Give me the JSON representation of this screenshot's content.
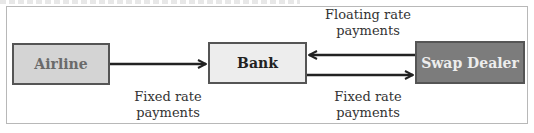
{
  "diagram": {
    "nodes": [
      {
        "id": "airline",
        "label": "Airline",
        "fill": "#d4d4d4"
      },
      {
        "id": "bank",
        "label": "Bank",
        "fill": "#ededed"
      },
      {
        "id": "swap_dealer",
        "label": "Swap Dealer",
        "fill": "#7c7c7c"
      }
    ],
    "edges": [
      {
        "from": "airline",
        "to": "bank",
        "label": "Fixed rate payments"
      },
      {
        "from": "swap_dealer",
        "to": "bank",
        "label": "Floating rate payments"
      },
      {
        "from": "bank",
        "to": "swap_dealer",
        "label": "Fixed rate payments"
      }
    ],
    "labels": {
      "fixed_left_line1": "Fixed rate",
      "fixed_left_line2": "payments",
      "float_line1": "Floating rate",
      "float_line2": "payments",
      "fixed_right_line1": "Fixed rate",
      "fixed_right_line2": "payments"
    }
  }
}
